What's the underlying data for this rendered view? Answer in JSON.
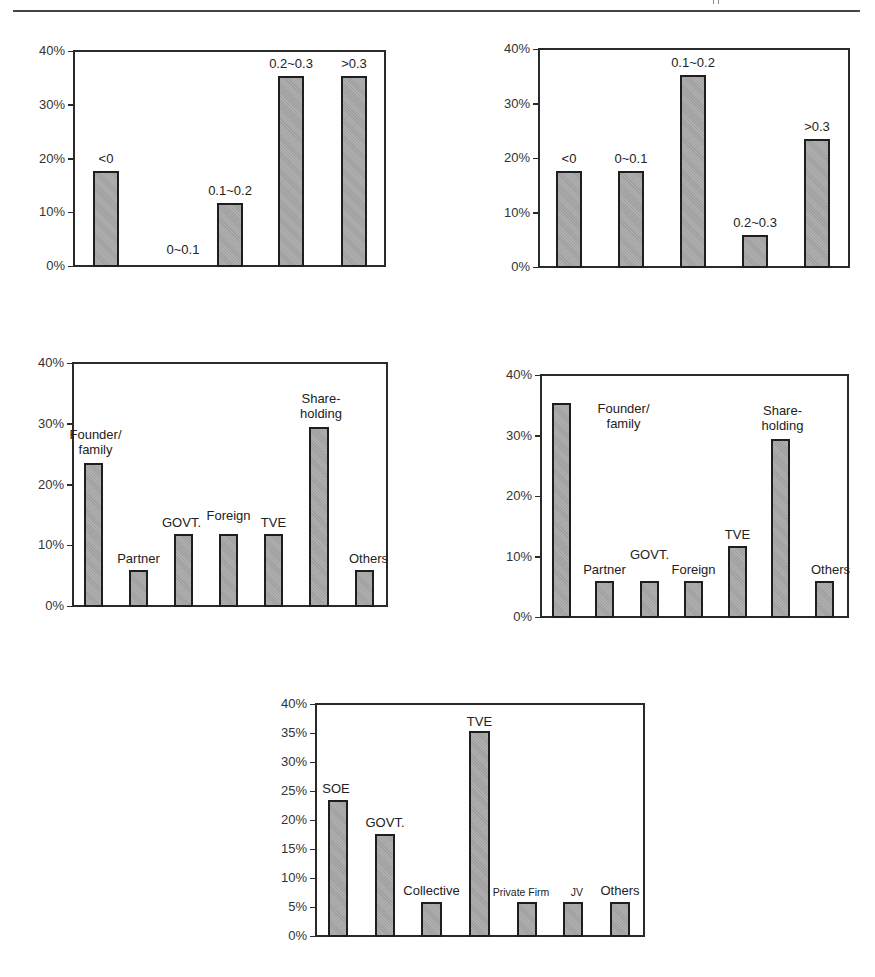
{
  "chart_data": [
    {
      "id": "chart-top-left",
      "type": "bar",
      "title": "",
      "xlabel": "",
      "ylabel": "",
      "ylim": [
        0,
        40
      ],
      "yticks": [
        "0%",
        "10%",
        "20%",
        "30%",
        "40%"
      ],
      "grid": false,
      "legend": null,
      "categories": [
        "<0",
        "0~0.1",
        "0.1~0.2",
        "0.2~0.3",
        ">0.3"
      ],
      "values": [
        17.6,
        0,
        11.8,
        35.3,
        35.3
      ],
      "bar_labels": [
        "<0",
        "0~0.1",
        "0.1~0.2",
        "0.2~0.3",
        ">0.3"
      ]
    },
    {
      "id": "chart-top-right",
      "type": "bar",
      "title": "",
      "xlabel": "",
      "ylabel": "",
      "ylim": [
        0,
        40
      ],
      "yticks": [
        "0%",
        "10%",
        "20%",
        "30%",
        "40%"
      ],
      "grid": false,
      "legend": null,
      "categories": [
        "<0",
        "0~0.1",
        "0.1~0.2",
        "0.2~0.3",
        ">0.3"
      ],
      "values": [
        17.6,
        17.6,
        35.3,
        5.9,
        23.5
      ],
      "bar_labels": [
        "<0",
        "0~0.1",
        "0.1~0.2",
        "0.2~0.3",
        ">0.3"
      ]
    },
    {
      "id": "chart-middle-left",
      "type": "bar",
      "title": "",
      "xlabel": "",
      "ylabel": "",
      "ylim": [
        0,
        40
      ],
      "yticks": [
        "0%",
        "10%",
        "20%",
        "30%",
        "40%"
      ],
      "grid": false,
      "legend": null,
      "categories": [
        "Founder/family",
        "Partner",
        "GOVT.",
        "Foreign",
        "TVE",
        "Share-holding",
        "Others"
      ],
      "values": [
        23.5,
        5.9,
        11.8,
        11.8,
        11.8,
        29.4,
        5.9
      ],
      "bar_labels": [
        "Founder/\nfamily",
        "Partner",
        "GOVT.",
        "Foreign",
        "TVE",
        "Share-\nholding",
        "Others"
      ]
    },
    {
      "id": "chart-middle-right",
      "type": "bar",
      "title": "",
      "xlabel": "",
      "ylabel": "",
      "ylim": [
        0,
        40
      ],
      "yticks": [
        "0%",
        "10%",
        "20%",
        "30%",
        "40%"
      ],
      "grid": false,
      "legend": null,
      "categories": [
        "Founder/family",
        "Partner",
        "GOVT.",
        "Foreign",
        "TVE",
        "Share-holding",
        "Others"
      ],
      "values": [
        35.3,
        5.9,
        5.9,
        5.9,
        11.8,
        29.4,
        5.9
      ],
      "bar_labels": [
        "Founder/\nfamily",
        "Partner",
        "GOVT.",
        "Foreign",
        "TVE",
        "Share-\nholding",
        "Others"
      ]
    },
    {
      "id": "chart-bottom",
      "type": "bar",
      "title": "",
      "xlabel": "",
      "ylabel": "",
      "ylim": [
        0,
        40
      ],
      "yticks": [
        "0%",
        "5%",
        "10%",
        "15%",
        "20%",
        "25%",
        "30%",
        "35%",
        "40%"
      ],
      "grid": false,
      "legend": null,
      "categories": [
        "SOE",
        "GOVT.",
        "Collective",
        "TVE",
        "Private Firm",
        "JV",
        "Others"
      ],
      "values": [
        23.5,
        17.6,
        5.9,
        35.3,
        5.9,
        5.9,
        5.9
      ],
      "bar_labels": [
        "SOE",
        "GOVT.",
        "Collective",
        "TVE",
        "Private Firm",
        "JV",
        "Others"
      ]
    }
  ],
  "layout": [
    {
      "frame": {
        "left": 73,
        "top": 50,
        "width": 313,
        "height": 217
      },
      "bars": [
        {
          "x": 93,
          "w": 26,
          "label_dx": 0,
          "label_dy": -20
        },
        {
          "x": 156,
          "w": 26,
          "label_dx": 14,
          "label_dy": -24
        },
        {
          "x": 217,
          "w": 26,
          "label_dx": 0,
          "label_dy": -20
        },
        {
          "x": 278,
          "w": 26,
          "label_dx": 0,
          "label_dy": -20
        },
        {
          "x": 341,
          "w": 26,
          "label_dx": 0,
          "label_dy": -20
        }
      ]
    },
    {
      "frame": {
        "left": 538,
        "top": 48,
        "width": 312,
        "height": 220
      },
      "bars": [
        {
          "x": 556,
          "w": 26,
          "label_dx": 0,
          "label_dy": -20
        },
        {
          "x": 618,
          "w": 26,
          "label_dx": 0,
          "label_dy": -20
        },
        {
          "x": 680,
          "w": 26,
          "label_dx": 0,
          "label_dy": -20
        },
        {
          "x": 742,
          "w": 26,
          "label_dx": 0,
          "label_dy": -20
        },
        {
          "x": 804,
          "w": 26,
          "label_dx": 0,
          "label_dy": -20
        }
      ]
    },
    {
      "frame": {
        "left": 72,
        "top": 362,
        "width": 316,
        "height": 245
      },
      "bars": [
        {
          "x": 84,
          "w": 19,
          "label_dx": 2,
          "label_dy": -36
        },
        {
          "x": 129,
          "w": 19,
          "label_dx": 0,
          "label_dy": -19
        },
        {
          "x": 174,
          "w": 19,
          "label_dx": -2,
          "label_dy": -19
        },
        {
          "x": 219,
          "w": 19,
          "label_dx": 0,
          "label_dy": -26
        },
        {
          "x": 264,
          "w": 19,
          "label_dx": 0,
          "label_dy": -19
        },
        {
          "x": 309,
          "w": 20,
          "label_dx": 2,
          "label_dy": -36
        },
        {
          "x": 355,
          "w": 19,
          "label_dx": 4,
          "label_dy": -19
        }
      ]
    },
    {
      "frame": {
        "left": 540,
        "top": 374,
        "width": 309,
        "height": 244
      },
      "bars": [
        {
          "x": 552,
          "w": 19,
          "label_dx": 62,
          "label_dy": -2
        },
        {
          "x": 595,
          "w": 19,
          "label_dx": 0,
          "label_dy": -19
        },
        {
          "x": 640,
          "w": 19,
          "label_dx": 0,
          "label_dy": -34
        },
        {
          "x": 684,
          "w": 19,
          "label_dx": 0,
          "label_dy": -19
        },
        {
          "x": 728,
          "w": 19,
          "label_dx": 0,
          "label_dy": -19
        },
        {
          "x": 771,
          "w": 19,
          "label_dx": 2,
          "label_dy": -36
        },
        {
          "x": 815,
          "w": 19,
          "label_dx": 6,
          "label_dy": -19
        }
      ]
    },
    {
      "frame": {
        "left": 315,
        "top": 703,
        "width": 330,
        "height": 234
      },
      "bars": [
        {
          "x": 328,
          "w": 20,
          "label_dx": -2,
          "label_dy": -19
        },
        {
          "x": 375,
          "w": 20,
          "label_dx": 0,
          "label_dy": -19
        },
        {
          "x": 421,
          "w": 21,
          "label_dx": 0,
          "label_dy": -19
        },
        {
          "x": 469,
          "w": 21,
          "label_dx": 0,
          "label_dy": -17
        },
        {
          "x": 517,
          "w": 20,
          "label_dx": -6,
          "label_dy": -17,
          "small": true
        },
        {
          "x": 563,
          "w": 20,
          "label_dx": 4,
          "label_dy": -17,
          "small": true
        },
        {
          "x": 610,
          "w": 20,
          "label_dx": 0,
          "label_dy": -19
        }
      ]
    }
  ]
}
